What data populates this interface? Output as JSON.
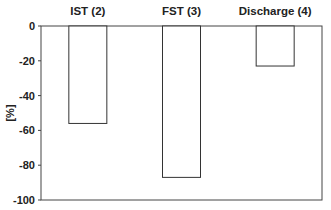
{
  "chart_data": {
    "type": "bar",
    "title": "",
    "xlabel": "",
    "ylabel": "[%]",
    "categories": [
      "IST (2)",
      "FST (3)",
      "Discharge (4)"
    ],
    "values": [
      -56,
      -87,
      -23
    ],
    "ylim": [
      -100,
      0
    ],
    "yticks": [
      0,
      -20,
      -40,
      -60,
      -80,
      -100
    ],
    "ytick_labels": [
      "0",
      "-20",
      "-40",
      "-60",
      "-80",
      "-100"
    ],
    "category_labels_position": "top",
    "grid": false,
    "legend": null,
    "bar_fill": "#ffffff",
    "bar_stroke": "#333333"
  }
}
